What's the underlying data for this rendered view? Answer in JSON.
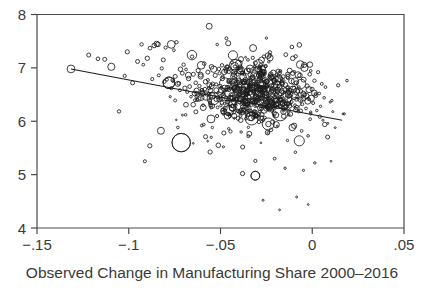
{
  "figure": {
    "background_color": "#ffffff",
    "foreground_color": "#1c1c1c",
    "axis_color": "#4a4a4a"
  },
  "chart_data": {
    "type": "scatter",
    "title": "",
    "subtitle": "",
    "xlabel": "Observed Change in Manufacturing Share 2000–2016",
    "ylabel": "",
    "xlim": [
      -0.15,
      0.05
    ],
    "ylim": [
      4,
      8
    ],
    "xticks": [
      -0.15,
      -0.1,
      -0.05,
      0,
      0.05
    ],
    "xticklabels": [
      "−.15",
      "−.1",
      "−.05",
      "0",
      ".05"
    ],
    "yticks": [
      4,
      5,
      6,
      7,
      8
    ],
    "yticklabels": [
      "4",
      "5",
      "6",
      "7",
      "8"
    ],
    "grid": false,
    "legend": null,
    "marker": "open-circle",
    "marker_size_encodes": "weight",
    "fit_line": {
      "type": "linear-fit",
      "x_start": -0.1315,
      "y_start": 6.98,
      "x_end": 0.0163,
      "y_end": 6.02
    },
    "annotations": [],
    "series": [
      {
        "name": "commuting zones",
        "n_points": 722,
        "points": [
          [
            -0.1315,
            6.98,
            3.9
          ],
          [
            -0.1218,
            7.24,
            2.0
          ],
          [
            -0.1168,
            7.17,
            1.8
          ],
          [
            -0.1131,
            7.16,
            2.0
          ],
          [
            -0.1095,
            7.02,
            3.6
          ],
          [
            -0.1022,
            6.85,
            1.6
          ],
          [
            -0.1008,
            7.3,
            2.1
          ],
          [
            -0.0979,
            6.72,
            2.0
          ],
          [
            -0.0952,
            7.12,
            2.0
          ],
          [
            -0.093,
            7.44,
            1.7
          ],
          [
            -0.0921,
            7.06,
            1.4
          ],
          [
            -0.0899,
            7.18,
            2.2
          ],
          [
            -0.0884,
            7.37,
            1.9
          ],
          [
            -0.0872,
            6.79,
            1.6
          ],
          [
            -0.0861,
            7.42,
            2.3
          ],
          [
            -0.0848,
            7.45,
            2.7
          ],
          [
            -0.0841,
            7.44,
            2.4
          ],
          [
            -0.0836,
            6.86,
            1.5
          ],
          [
            -0.082,
            6.99,
            1.6
          ],
          [
            -0.0812,
            7.15,
            2.0
          ],
          [
            -0.0806,
            6.74,
            1.7
          ],
          [
            -0.0799,
            7.38,
            1.6
          ],
          [
            -0.0792,
            6.78,
            1.5
          ],
          [
            -0.0781,
            6.72,
            5.8
          ],
          [
            -0.0774,
            6.46,
            1.1
          ],
          [
            -0.0768,
            6.62,
            1.6
          ],
          [
            -0.076,
            6.77,
            1.9
          ],
          [
            -0.0754,
            7.33,
            1.4
          ],
          [
            -0.0747,
            6.84,
            2.0
          ],
          [
            -0.074,
            7.48,
            1.7
          ],
          [
            -0.0733,
            6.7,
            2.5
          ],
          [
            -0.0727,
            6.71,
            1.8
          ],
          [
            -0.0721,
            6.58,
            1.5
          ],
          [
            -0.0714,
            5.6,
            9.2
          ],
          [
            -0.0708,
            6.9,
            1.9
          ],
          [
            -0.0701,
            7.06,
            1.7
          ],
          [
            -0.0694,
            6.62,
            2.1
          ],
          [
            -0.0688,
            6.97,
            1.4
          ],
          [
            -0.0681,
            6.55,
            1.6
          ],
          [
            -0.0674,
            6.8,
            2.2
          ],
          [
            -0.0668,
            6.65,
            1.9
          ],
          [
            -0.0661,
            6.46,
            1.3
          ],
          [
            -0.0655,
            7.21,
            1.7
          ],
          [
            -0.0648,
            6.88,
            2.0
          ],
          [
            -0.0641,
            6.52,
            2.4
          ],
          [
            -0.0635,
            6.72,
            1.8
          ],
          [
            -0.0628,
            6.4,
            1.5
          ],
          [
            -0.0622,
            6.95,
            2.1
          ],
          [
            -0.0615,
            6.66,
            1.7
          ],
          [
            -0.0608,
            6.84,
            2.6
          ],
          [
            -0.0602,
            6.58,
            1.9
          ],
          [
            -0.0595,
            6.3,
            1.4
          ],
          [
            -0.0589,
            7.08,
            1.8
          ],
          [
            -0.0582,
            6.74,
            2.2
          ],
          [
            -0.0575,
            6.5,
            1.6
          ],
          [
            -0.0569,
            6.92,
            2.0
          ],
          [
            -0.0562,
            6.62,
            1.7
          ],
          [
            -0.0556,
            6.38,
            1.5
          ],
          [
            -0.0549,
            7.02,
            2.3
          ],
          [
            -0.0542,
            6.7,
            1.9
          ],
          [
            -0.0536,
            6.46,
            1.6
          ],
          [
            -0.0529,
            6.86,
            2.1
          ],
          [
            -0.0523,
            6.58,
            2.5
          ],
          [
            -0.0516,
            6.26,
            1.4
          ],
          [
            -0.0509,
            6.98,
            1.8
          ],
          [
            -0.0503,
            6.66,
            2.0
          ],
          [
            -0.0496,
            6.42,
            1.7
          ],
          [
            -0.049,
            6.8,
            2.2
          ],
          [
            -0.0483,
            6.54,
            1.5
          ],
          [
            -0.0476,
            6.2,
            1.3
          ],
          [
            -0.047,
            6.94,
            1.9
          ],
          [
            -0.0463,
            6.62,
            2.4
          ],
          [
            -0.0457,
            6.36,
            1.6
          ],
          [
            -0.045,
            6.76,
            2.0
          ],
          [
            -0.0443,
            6.5,
            1.8
          ],
          [
            -0.0437,
            7.1,
            1.5
          ],
          [
            -0.043,
            6.88,
            2.1
          ],
          [
            -0.0424,
            6.58,
            1.7
          ],
          [
            -0.0417,
            6.3,
            1.4
          ],
          [
            -0.041,
            6.72,
            2.6
          ],
          [
            -0.0404,
            6.46,
            1.9
          ],
          [
            -0.0397,
            6.66,
            2.2
          ],
          [
            -0.0391,
            6.14,
            1.2
          ],
          [
            -0.0384,
            6.9,
            1.8
          ],
          [
            -0.0377,
            6.6,
            2.0
          ],
          [
            -0.0371,
            6.36,
            1.6
          ],
          [
            -0.0364,
            6.78,
            2.3
          ],
          [
            -0.0358,
            6.52,
            1.7
          ],
          [
            -0.0351,
            6.24,
            1.5
          ],
          [
            -0.0344,
            6.96,
            1.9
          ],
          [
            -0.0338,
            6.64,
            2.1
          ],
          [
            -0.0331,
            6.4,
            1.8
          ],
          [
            -0.0325,
            6.82,
            2.5
          ],
          [
            -0.0318,
            6.56,
            1.6
          ],
          [
            -0.0311,
            6.28,
            1.3
          ],
          [
            -0.0305,
            6.7,
            2.0
          ],
          [
            -0.0298,
            6.44,
            1.7
          ],
          [
            -0.0292,
            6.86,
            2.2
          ],
          [
            -0.0285,
            6.18,
            1.4
          ],
          [
            -0.0278,
            6.62,
            1.9
          ],
          [
            -0.0272,
            6.38,
            1.6
          ],
          [
            -0.0265,
            6.92,
            2.4
          ],
          [
            -0.0259,
            6.58,
            2.0
          ],
          [
            -0.0252,
            6.32,
            1.5
          ],
          [
            -0.0245,
            6.74,
            2.1
          ],
          [
            -0.0239,
            6.48,
            1.8
          ],
          [
            -0.0232,
            6.2,
            1.3
          ],
          [
            -0.0226,
            6.88,
            2.3
          ],
          [
            -0.0219,
            6.6,
            1.9
          ],
          [
            -0.0212,
            6.34,
            1.6
          ],
          [
            -0.0206,
            6.76,
            2.6
          ],
          [
            -0.0199,
            6.5,
            1.7
          ],
          [
            -0.0193,
            6.26,
            1.4
          ],
          [
            -0.0186,
            6.94,
            2.0
          ],
          [
            -0.0179,
            6.64,
            2.2
          ],
          [
            -0.0173,
            6.4,
            1.8
          ],
          [
            -0.0166,
            6.8,
            1.5
          ],
          [
            -0.016,
            6.54,
            1.9
          ],
          [
            -0.0153,
            6.22,
            1.3
          ],
          [
            -0.0146,
            6.68,
            2.4
          ],
          [
            -0.014,
            6.44,
            1.7
          ],
          [
            -0.0133,
            6.84,
            2.1
          ],
          [
            -0.0127,
            6.12,
            1.2
          ],
          [
            -0.012,
            6.58,
            1.8
          ],
          [
            -0.0113,
            6.36,
            1.6
          ],
          [
            -0.0107,
            6.9,
            2.2
          ],
          [
            -0.01,
            6.62,
            1.9
          ],
          [
            -0.0094,
            6.3,
            1.4
          ],
          [
            -0.0087,
            6.72,
            2.0
          ],
          [
            -0.008,
            6.46,
            1.7
          ],
          [
            -0.0074,
            6.18,
            1.3
          ],
          [
            -0.0067,
            6.86,
            2.3
          ],
          [
            -0.0061,
            6.56,
            1.8
          ],
          [
            -0.0054,
            6.32,
            1.5
          ],
          [
            -0.0047,
            6.78,
            2.5
          ],
          [
            -0.0041,
            6.5,
            1.9
          ],
          [
            -0.0034,
            6.24,
            1.4
          ],
          [
            -0.0028,
            6.66,
            2.1
          ],
          [
            -0.0021,
            6.42,
            1.6
          ],
          [
            -0.0014,
            6.88,
            1.8
          ],
          [
            -0.0008,
            6.14,
            1.2
          ],
          [
            -0.0001,
            6.6,
            2.0
          ],
          [
            0.0005,
            6.34,
            1.5
          ],
          [
            0.0012,
            6.76,
            1.7
          ],
          [
            0.0019,
            6.48,
            1.9
          ],
          [
            0.0025,
            6.2,
            1.3
          ],
          [
            0.0032,
            6.92,
            1.6
          ],
          [
            0.0038,
            6.52,
            1.4
          ],
          [
            0.0045,
            6.28,
            1.2
          ],
          [
            0.0052,
            6.7,
            1.5
          ],
          [
            0.0058,
            6.02,
            1.1
          ],
          [
            0.0065,
            6.44,
            1.3
          ],
          [
            0.0072,
            6.64,
            1.4
          ],
          [
            0.0085,
            5.96,
            1.0
          ],
          [
            0.0098,
            6.36,
            1.1
          ],
          [
            0.0112,
            6.18,
            1.0
          ],
          [
            0.0125,
            5.88,
            0.9
          ],
          [
            -0.0512,
            5.55,
            2.3
          ],
          [
            -0.038,
            5.02,
            2.1
          ],
          [
            -0.031,
            4.98,
            4.4
          ],
          [
            -0.0205,
            5.3,
            1.4
          ],
          [
            -0.0148,
            5.12,
            1.2
          ],
          [
            -0.0092,
            5.42,
            1.3
          ],
          [
            -0.0048,
            5.08,
            1.1
          ],
          [
            0.0014,
            5.22,
            1.2
          ],
          [
            -0.0268,
            4.52,
            1.0
          ],
          [
            -0.0178,
            4.34,
            0.9
          ],
          [
            -0.0085,
            4.58,
            1.0
          ],
          [
            -0.0022,
            4.44,
            0.9
          ],
          [
            -0.069,
            6.12,
            1.3
          ],
          [
            -0.0602,
            5.92,
            1.4
          ],
          [
            -0.0455,
            5.86,
            1.2
          ],
          [
            -0.0348,
            5.72,
            1.5
          ],
          [
            -0.024,
            5.78,
            1.3
          ],
          [
            -0.0135,
            5.64,
            1.2
          ],
          [
            -0.0058,
            5.82,
            1.4
          ]
        ]
      }
    ]
  },
  "axes": {
    "x_axis_name": "x-axis",
    "y_axis_name": "y-axis"
  }
}
